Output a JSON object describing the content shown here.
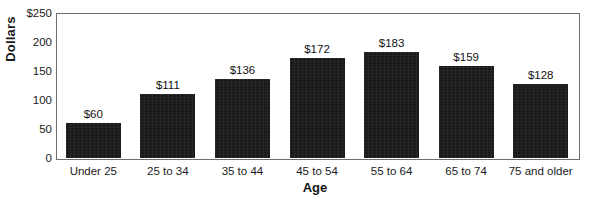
{
  "chart_data": {
    "type": "bar",
    "title": "",
    "xlabel": "Age",
    "ylabel": "Dollars",
    "categories": [
      "Under 25",
      "25 to 34",
      "35 to 44",
      "45 to 54",
      "55 to 64",
      "65 to 74",
      "75 and older"
    ],
    "values": [
      60,
      111,
      136,
      172,
      183,
      159,
      128
    ],
    "value_labels": [
      "$60",
      "$111",
      "$136",
      "$172",
      "$183",
      "$159",
      "$128"
    ],
    "ylim": [
      0,
      250
    ],
    "yticks": [
      0,
      50,
      100,
      150,
      200,
      250
    ],
    "ytick_labels": [
      "0",
      "50",
      "100",
      "150",
      "200",
      "$250"
    ],
    "grid": false,
    "legend": null,
    "bar_color": "#191919",
    "frame_color": "#6e6e6e",
    "background_color": "#ffffff"
  }
}
